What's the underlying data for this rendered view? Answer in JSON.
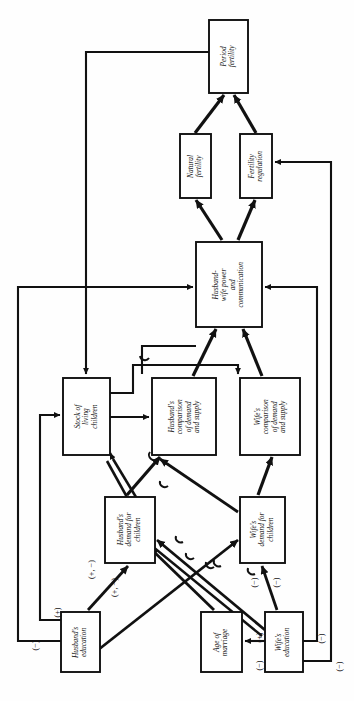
{
  "figure": {
    "type": "flow-diagram",
    "orientation": "rotated-90-ccw",
    "title": "",
    "nodes": [
      {
        "id": "period_fertility",
        "label": "Period\nfertility",
        "x": 209,
        "y": 20,
        "w": 39,
        "h": 73
      },
      {
        "id": "natural_fertility",
        "label": "Natural\nfertility",
        "x": 180,
        "y": 134,
        "w": 31,
        "h": 64
      },
      {
        "id": "fertility_reg",
        "label": "Fertility\nregulation",
        "x": 240,
        "y": 134,
        "w": 32,
        "h": 64
      },
      {
        "id": "hw_power",
        "label": "Husband-\nwife power\nand\ncommunication",
        "x": 196,
        "y": 242,
        "w": 66,
        "h": 85
      },
      {
        "id": "stock_children",
        "label": "Stock of\nliving\nchildren",
        "x": 63,
        "y": 378,
        "w": 47,
        "h": 77
      },
      {
        "id": "hus_comparison",
        "label": "Husband's\ncomparison\nof demand\nand supply",
        "x": 152,
        "y": 378,
        "w": 64,
        "h": 77
      },
      {
        "id": "wife_comparison",
        "label": "Wife's\ncomparison\nof demand\nand supply",
        "x": 240,
        "y": 378,
        "w": 60,
        "h": 77
      },
      {
        "id": "hus_demand",
        "label": "Husband's\ndemand for\nchildren",
        "x": 105,
        "y": 497,
        "w": 50,
        "h": 66
      },
      {
        "id": "wife_demand",
        "label": "Wife's\ndemand for\nchildren",
        "x": 240,
        "y": 497,
        "w": 45,
        "h": 66
      },
      {
        "id": "hus_education",
        "label": "Husband's\neducation",
        "x": 61,
        "y": 612,
        "w": 39,
        "h": 60
      },
      {
        "id": "age_marriage",
        "label": "Age of\nmarriage",
        "x": 201,
        "y": 612,
        "w": 41,
        "h": 60
      },
      {
        "id": "wife_education",
        "label": "Wife's\neducation",
        "x": 265,
        "y": 612,
        "w": 38,
        "h": 60
      }
    ],
    "sign_labels": [
      {
        "id": "s1",
        "text": "(+, −)",
        "x": 78,
        "y": 556
      },
      {
        "id": "s2",
        "text": "(+, −)",
        "x": 101,
        "y": 574
      },
      {
        "id": "s3",
        "text": "(+)",
        "x": 46,
        "y": 601
      },
      {
        "id": "s4",
        "text": "(−)",
        "x": 24,
        "y": 634
      },
      {
        "id": "s5",
        "text": "(−)",
        "x": 243,
        "y": 571
      },
      {
        "id": "s6",
        "text": "(−)",
        "x": 265,
        "y": 571
      },
      {
        "id": "s7",
        "text": "(+)",
        "x": 248,
        "y": 626
      },
      {
        "id": "s8",
        "text": "(−)",
        "x": 248,
        "y": 654
      },
      {
        "id": "s9",
        "text": "(−)",
        "x": 310,
        "y": 627
      },
      {
        "id": "s10",
        "text": "(−)",
        "x": 328,
        "y": 655
      }
    ],
    "colors": {
      "stroke": "#111111",
      "fill": "#ffffff",
      "background": "#ffffff"
    }
  }
}
